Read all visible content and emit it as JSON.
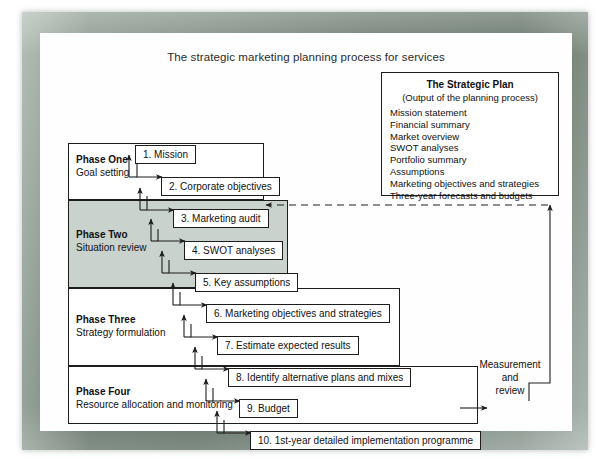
{
  "figure": {
    "title": "The strategic marketing planning process for services"
  },
  "strategic_plan": {
    "heading": "The Strategic Plan",
    "subheading": "(Output of the planning process)",
    "items": [
      "Mission statement",
      "Financial summary",
      "Market overview",
      "SWOT analyses",
      "Portfolio summary",
      "Assumptions",
      "Marketing objectives and strategies",
      "Three-year forecasts and budgets"
    ]
  },
  "phases": [
    {
      "name": "Phase One",
      "subtitle": "Goal setting"
    },
    {
      "name": "Phase Two",
      "subtitle": "Situation review"
    },
    {
      "name": "Phase Three",
      "subtitle": "Strategy formulation"
    },
    {
      "name": "Phase Four",
      "subtitle": "Resource allocation and monitoring"
    }
  ],
  "steps": [
    {
      "number": "1.",
      "label": "1. Mission"
    },
    {
      "number": "2.",
      "label": "2. Corporate objectives"
    },
    {
      "number": "3.",
      "label": "3. Marketing audit"
    },
    {
      "number": "4.",
      "label": "4. SWOT analyses"
    },
    {
      "number": "5.",
      "label": "5. Key assumptions"
    },
    {
      "number": "6.",
      "label": "6. Marketing objectives and strategies"
    },
    {
      "number": "7.",
      "label": "7. Estimate expected results"
    },
    {
      "number": "8.",
      "label": "8. Identify alternative plans and mixes"
    },
    {
      "number": "9.",
      "label": "9. Budget"
    },
    {
      "number": "10.",
      "label": "10. 1st-year detailed implementation programme"
    }
  ],
  "feedback": {
    "label_line1": "Measurement",
    "label_line2": "and",
    "label_line3": "review"
  },
  "colors": {
    "frame": "#6e7d72",
    "shaded_phase": "#c9d2cc",
    "line": "#1d1d1d",
    "canvas": "#fefefe"
  }
}
